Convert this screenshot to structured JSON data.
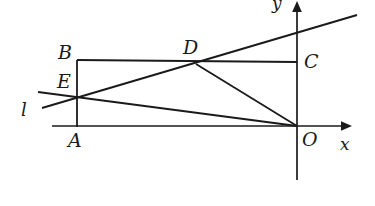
{
  "figure": {
    "type": "geometry-diagram",
    "width": 375,
    "height": 206,
    "background_color": "#ffffff",
    "stroke_color": "#1a1a1a"
  },
  "axes": {
    "x_axis": {
      "label": "x",
      "label_x": 340,
      "label_y": 136,
      "start_x": 52,
      "start_y": 126,
      "end_x": 348,
      "end_y": 126,
      "has_arrow": true
    },
    "y_axis": {
      "label": "y",
      "label_x": 272,
      "label_y": -4,
      "start_x": 297,
      "start_y": 180,
      "end_x": 297,
      "end_y": 4,
      "has_arrow": true
    }
  },
  "points": [
    {
      "name": "A",
      "x": 77,
      "y": 126,
      "label": "A",
      "label_x": 68,
      "label_y": 131
    },
    {
      "name": "B",
      "x": 77,
      "y": 60,
      "label": "B",
      "label_x": 58,
      "label_y": 42
    },
    {
      "name": "C",
      "x": 297,
      "y": 62,
      "label": "C",
      "label_x": 304,
      "label_y": 52
    },
    {
      "name": "D",
      "x": 196,
      "y": 64,
      "label": "D",
      "label_x": 183,
      "label_y": 38
    },
    {
      "name": "E",
      "x": 77,
      "y": 97,
      "label": "E",
      "label_x": 57,
      "label_y": 72
    },
    {
      "name": "O",
      "x": 297,
      "y": 126,
      "label": "O",
      "label_x": 302,
      "label_y": 131
    }
  ],
  "segments": [
    {
      "name": "AB",
      "from": "A",
      "to": "B",
      "x1": 77,
      "y1": 126,
      "x2": 77,
      "y2": 60
    },
    {
      "name": "BC",
      "from": "B",
      "to": "C",
      "x1": 77,
      "y1": 60,
      "x2": 297,
      "y2": 62
    },
    {
      "name": "CO",
      "from": "C",
      "to": "O",
      "x1": 297,
      "y1": 62,
      "x2": 297,
      "y2": 126
    },
    {
      "name": "EO",
      "from": "E",
      "to": "O",
      "x1": 77,
      "y1": 97,
      "x2": 297,
      "y2": 126
    },
    {
      "name": "DO",
      "from": "D",
      "to": "O",
      "x1": 196,
      "y1": 64,
      "x2": 297,
      "y2": 126
    }
  ],
  "lines": [
    {
      "name": "l",
      "label": "l",
      "label_x": 20,
      "label_y": 103,
      "x1": 42,
      "y1": 108,
      "x2": 357,
      "y2": 15,
      "passes_through": [
        "E",
        "D"
      ]
    }
  ]
}
